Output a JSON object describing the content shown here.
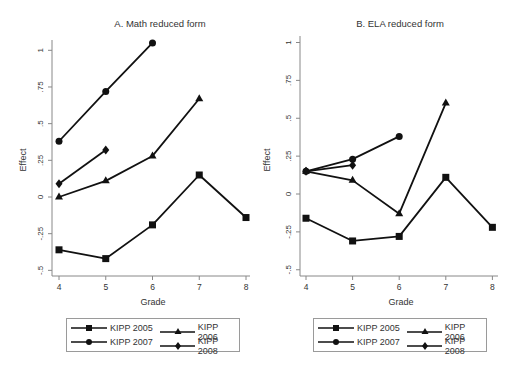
{
  "chart_data": [
    {
      "type": "line",
      "title": "A. Math reduced form",
      "xlabel": "Grade",
      "ylabel": "Effect",
      "x": [
        4,
        5,
        6,
        7,
        8
      ],
      "xticks": [
        "4",
        "5",
        "6",
        "7",
        "8"
      ],
      "yticks": [
        -0.5,
        -0.25,
        0,
        0.25,
        0.5,
        0.75,
        1
      ],
      "ytick_labels": [
        "-.5",
        "-.25",
        "0",
        ".25",
        ".5",
        ".75",
        "1"
      ],
      "ylim": [
        -0.5,
        1.05
      ],
      "grid": false,
      "legend_position": "bottom",
      "series": [
        {
          "name": "KIPP 2005",
          "marker": "square",
          "x": [
            4,
            5,
            6,
            7,
            8
          ],
          "values": [
            -0.36,
            -0.42,
            -0.19,
            0.15,
            -0.14
          ]
        },
        {
          "name": "KIPP 2006",
          "marker": "triangle",
          "x": [
            4,
            5,
            6,
            7
          ],
          "values": [
            0.0,
            0.11,
            0.28,
            0.67
          ]
        },
        {
          "name": "KIPP 2007",
          "marker": "circle",
          "x": [
            4,
            5,
            6
          ],
          "values": [
            0.38,
            0.72,
            1.05
          ]
        },
        {
          "name": "KIPP 2008",
          "marker": "diamond",
          "x": [
            4,
            5
          ],
          "values": [
            0.09,
            0.32
          ]
        }
      ]
    },
    {
      "type": "line",
      "title": "B. ELA reduced form",
      "xlabel": "Grade",
      "ylabel": "Effect",
      "x": [
        4,
        5,
        6,
        7,
        8
      ],
      "xticks": [
        "4",
        "5",
        "6",
        "7",
        "8"
      ],
      "yticks": [
        -0.5,
        -0.25,
        0,
        0.25,
        0.5,
        0.75,
        1
      ],
      "ytick_labels": [
        "-.5",
        "-.25",
        "0",
        ".25",
        ".5",
        ".75",
        "1"
      ],
      "ylim": [
        -0.5,
        1.0
      ],
      "grid": false,
      "legend_position": "bottom",
      "series": [
        {
          "name": "KIPP 2005",
          "marker": "square",
          "x": [
            4,
            5,
            6,
            7,
            8
          ],
          "values": [
            -0.16,
            -0.31,
            -0.28,
            0.11,
            -0.22
          ]
        },
        {
          "name": "KIPP 2006",
          "marker": "triangle",
          "x": [
            4,
            5,
            6,
            7
          ],
          "values": [
            0.15,
            0.09,
            -0.13,
            0.6
          ]
        },
        {
          "name": "KIPP 2007",
          "marker": "circle",
          "x": [
            4,
            5,
            6
          ],
          "values": [
            0.15,
            0.23,
            0.38
          ]
        },
        {
          "name": "KIPP 2008",
          "marker": "diamond",
          "x": [
            4,
            5
          ],
          "values": [
            0.15,
            0.19
          ]
        }
      ]
    }
  ],
  "layout": [
    {
      "x0": 59,
      "xstep": 46.75,
      "y0": 197,
      "ypx_per_unit": 146.7,
      "axis_left": 52,
      "axis_bottom": 276,
      "axis_right": 250,
      "axis_top": 40,
      "title_x": 160,
      "title_y": 27,
      "ylabel_x": 26,
      "ylabel_y": 160,
      "xlabel_y": 305,
      "legend_left": 66,
      "legend_top": 318
    },
    {
      "x0": 306,
      "xstep": 46.6,
      "y0": 194,
      "ypx_per_unit": 151.5,
      "axis_left": 300,
      "axis_bottom": 276,
      "axis_right": 498,
      "axis_top": 36,
      "title_x": 400,
      "title_y": 27,
      "ylabel_x": 270,
      "ylabel_y": 160,
      "xlabel_y": 305,
      "legend_left": 313,
      "legend_top": 318
    }
  ],
  "colors": {
    "line": "#111111",
    "axis": "#888888",
    "text": "#333333"
  }
}
